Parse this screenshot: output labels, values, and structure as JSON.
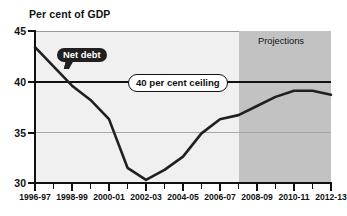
{
  "chart_data": {
    "type": "line",
    "title": "Per cent of GDP",
    "xlabel": "",
    "ylabel": "Per cent of GDP",
    "ylim": [
      30,
      45
    ],
    "yticks": [
      30,
      35,
      40,
      45
    ],
    "ytick_labels": [
      "30",
      "35",
      "40",
      "45"
    ],
    "grid": true,
    "legend": "none",
    "x": [
      "1996-97",
      "1997-98",
      "1998-99",
      "1999-00",
      "2000-01",
      "2001-02",
      "2002-03",
      "2003-04",
      "2004-05",
      "2005-06",
      "2006-07",
      "2007-08",
      "2008-09",
      "2009-10",
      "2010-11",
      "2011-12",
      "2012-13"
    ],
    "xtick_labels": [
      "1996-97",
      "",
      "1998-99",
      "",
      "2000-01",
      "",
      "2002-03",
      "",
      "2004-05",
      "",
      "2006-07",
      "",
      "2008-09",
      "",
      "2010-11",
      "",
      "2012-13"
    ],
    "series": [
      {
        "name": "Net debt",
        "color": "#231f20",
        "values": [
          43.4,
          41.5,
          39.6,
          38.2,
          36.3,
          31.5,
          30.3,
          31.3,
          32.6,
          34.9,
          36.3,
          36.7,
          37.6,
          38.5,
          39.1,
          39.1,
          38.7
        ]
      }
    ],
    "annotations": [
      {
        "id": "net-debt-callout",
        "text": "Net debt",
        "style": "dark-bubble",
        "x": "1997-98",
        "y": 42.2
      },
      {
        "id": "ceiling-callout",
        "text": "40 per cent ceiling",
        "style": "white-rounded-box",
        "x": "2003-04",
        "y": 40
      },
      {
        "id": "projections-label",
        "text": "Projections",
        "style": "plain",
        "x": "2010-11",
        "y": 44.0
      }
    ],
    "reference_lines": [
      {
        "id": "forty-per-cent-ceiling",
        "y": 40,
        "color": "#111111",
        "width": 2
      }
    ],
    "shaded_regions": [
      {
        "id": "projections-band",
        "label": "Projections",
        "from": "2007-08",
        "to": "2012-13",
        "color": "#c2c2c2"
      }
    ],
    "colors": {
      "plot_background": "#f0f0f0",
      "projection_background": "#c2c2c2",
      "line": "#231f20",
      "axis": "#111111",
      "gridline": "#a8a8a8",
      "page_background": "#ffffff"
    }
  }
}
